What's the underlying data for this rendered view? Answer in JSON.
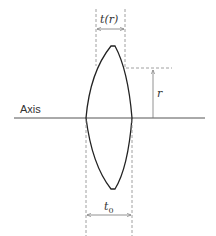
{
  "diagram": {
    "labels": {
      "axis": "Axis",
      "thickness_at_r": "t(r)",
      "radius": "r",
      "center_thickness": "t0"
    },
    "colors": {
      "lens_outline": "#222222",
      "axis_line": "#555555",
      "dimension_lines": "#777777",
      "text": "#333333"
    }
  }
}
